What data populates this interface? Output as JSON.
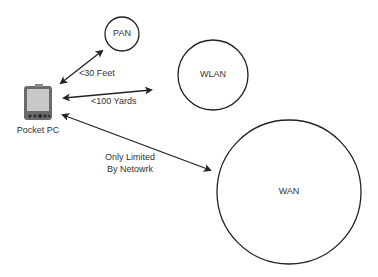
{
  "device": {
    "label": "Pocket PC",
    "icon": "pda-icon"
  },
  "networks": [
    {
      "id": "pan",
      "label": "PAN"
    },
    {
      "id": "wlan",
      "label": "WLAN"
    },
    {
      "id": "wan",
      "label": "WAN"
    }
  ],
  "links": [
    {
      "to": "pan",
      "label": "<30 Feet"
    },
    {
      "to": "wlan",
      "label": "<100 Yards"
    },
    {
      "to": "wan",
      "label_line1": "Only Limited",
      "label_line2": "By Netowrk"
    }
  ],
  "colors": {
    "stroke": "#222222",
    "text": "#333333",
    "device_body": "#6b6b6b",
    "device_screen": "#c8c8c8"
  }
}
